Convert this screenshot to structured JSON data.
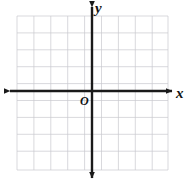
{
  "figure": {
    "kind": "cartesian-coordinate-plane",
    "width": 190,
    "height": 183,
    "background_color": "#ffffff"
  },
  "labels": {
    "x_axis": "x",
    "y_axis": "y",
    "origin": "O"
  },
  "axes": {
    "color": "#1a1a1a",
    "stroke_width": 2.4,
    "origin_x": 92,
    "origin_y": 91,
    "x_axis_start": 10,
    "x_axis_end": 172,
    "y_axis_start": 7,
    "y_axis_end": 178,
    "arrowheads": [
      "left",
      "right",
      "up",
      "down"
    ],
    "tick_labels": []
  },
  "grid": {
    "color": "#c9c9cf",
    "stroke_width": 0.7,
    "cell_size": 16.9,
    "left": 17,
    "right": 168,
    "top": 16,
    "bottom": 170,
    "vertical_lines": [
      17,
      33.9,
      50.8,
      67.7,
      84.6,
      101.5,
      118.4,
      135.3,
      152.2,
      168
    ],
    "horizontal_lines": [
      16,
      32.9,
      49.8,
      66.7,
      83.6,
      100.5,
      117.4,
      134.3,
      151.2,
      170
    ],
    "visible": true
  }
}
